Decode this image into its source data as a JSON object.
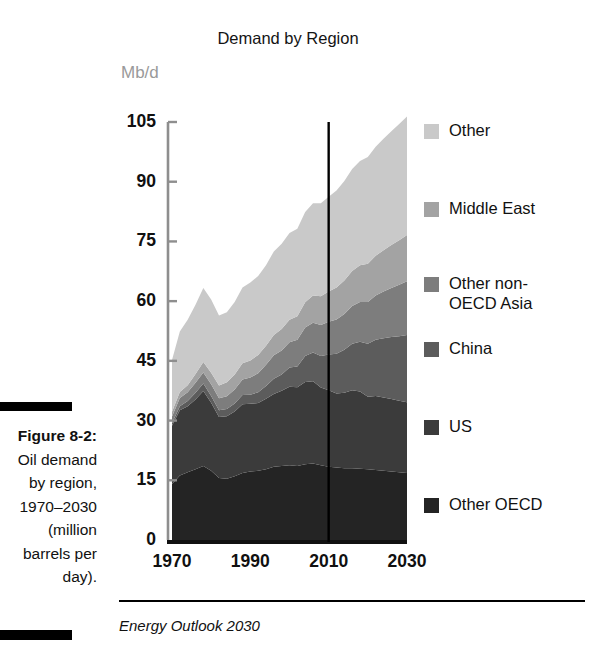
{
  "figure": {
    "label": "Figure 8-2:",
    "caption": "Oil demand by region, 1970–2030 (million barrels per day).",
    "caption_lines": [
      "Figure 8-2:",
      "Oil demand",
      "by region,",
      "1970–2030",
      "(million",
      "barrels per",
      "day)."
    ]
  },
  "source": {
    "text": "Energy Outlook 2030"
  },
  "chart_data": {
    "type": "area",
    "stacked": true,
    "title": "Demand by Region",
    "subtitle": "",
    "xlabel": "",
    "ylabel": "Mb/d",
    "unit_label": "Mb/d",
    "xlim": [
      1970,
      2030
    ],
    "ylim": [
      0,
      105
    ],
    "xticks": [
      1970,
      1990,
      2010,
      2030
    ],
    "yticks": [
      0,
      15,
      30,
      45,
      60,
      75,
      90,
      105
    ],
    "grid": false,
    "legend_position": "right",
    "annotations": [
      {
        "name": "forecast-divider",
        "type": "vline",
        "x": 2010,
        "label": ""
      }
    ],
    "colors": {
      "other": "#c9c9c9",
      "middle_east": "#a3a3a3",
      "other_non_oecd_asia": "#7d7d7d",
      "china": "#5c5c5c",
      "us": "#3b3b3b",
      "other_oecd": "#242424",
      "axis": "#8e8e8e",
      "text": "#111111",
      "unit_text": "#9a9a9a",
      "divider": "#000000"
    },
    "x": [
      1970,
      1972,
      1974,
      1976,
      1978,
      1980,
      1982,
      1984,
      1986,
      1988,
      1990,
      1992,
      1994,
      1996,
      1998,
      2000,
      2002,
      2004,
      2006,
      2008,
      2010,
      2012,
      2014,
      2016,
      2018,
      2020,
      2022,
      2024,
      2026,
      2028,
      2030
    ],
    "series": [
      {
        "name": "Other OECD",
        "key": "other_oecd",
        "color": "#242424",
        "values": [
          14.0,
          16.2,
          17.0,
          17.8,
          18.6,
          17.4,
          15.6,
          15.4,
          16.0,
          16.8,
          17.2,
          17.4,
          17.8,
          18.4,
          18.6,
          18.8,
          18.6,
          19.0,
          19.2,
          18.8,
          18.4,
          18.2,
          18.0,
          18.0,
          17.9,
          17.8,
          17.6,
          17.4,
          17.2,
          17.0,
          16.8
        ]
      },
      {
        "name": "US",
        "key": "us",
        "color": "#3b3b3b",
        "values": [
          14.7,
          16.4,
          16.6,
          17.5,
          18.8,
          17.1,
          15.3,
          15.7,
          16.3,
          17.3,
          17.0,
          17.0,
          17.7,
          18.3,
          18.9,
          19.7,
          19.8,
          20.7,
          20.7,
          19.5,
          19.2,
          18.6,
          19.0,
          19.6,
          19.4,
          18.2,
          18.6,
          18.4,
          18.2,
          18.0,
          17.8
        ]
      },
      {
        "name": "China",
        "key": "china",
        "color": "#5c5c5c",
        "values": [
          0.6,
          1.0,
          1.3,
          1.7,
          1.9,
          1.7,
          1.7,
          1.8,
          2.0,
          2.3,
          2.3,
          2.7,
          3.2,
          3.8,
          4.1,
          4.8,
          5.2,
          6.5,
          7.2,
          7.9,
          9.0,
          10.0,
          10.8,
          11.7,
          12.5,
          13.3,
          14.1,
          14.9,
          15.6,
          16.2,
          16.9
        ]
      },
      {
        "name": "Other non-OECD Asia",
        "key": "other_non_oecd_asia",
        "color": "#7d7d7d",
        "values": [
          1.7,
          2.1,
          2.2,
          2.5,
          2.8,
          2.9,
          3.0,
          3.2,
          3.5,
          3.9,
          4.3,
          4.8,
          5.3,
          5.9,
          6.0,
          6.4,
          6.7,
          7.2,
          7.5,
          7.8,
          8.2,
          8.6,
          9.0,
          9.5,
          10.0,
          10.5,
          11.1,
          11.7,
          12.3,
          12.9,
          13.5
        ]
      },
      {
        "name": "Middle East",
        "key": "middle_east",
        "color": "#a3a3a3",
        "values": [
          1.2,
          1.5,
          1.8,
          2.2,
          2.6,
          2.9,
          3.2,
          3.5,
          3.8,
          4.1,
          4.3,
          4.6,
          4.8,
          5.1,
          5.4,
          5.6,
          5.9,
          6.3,
          6.8,
          7.2,
          7.6,
          8.0,
          8.4,
          8.8,
          9.2,
          9.6,
          10.0,
          10.4,
          10.8,
          11.2,
          11.6
        ]
      },
      {
        "name": "Other",
        "key": "other",
        "color": "#c9c9c9",
        "values": [
          13.0,
          15.2,
          16.4,
          17.4,
          18.6,
          18.4,
          17.6,
          17.6,
          18.2,
          19.0,
          19.6,
          19.8,
          20.2,
          21.0,
          21.4,
          21.8,
          22.0,
          22.7,
          23.2,
          23.4,
          23.8,
          24.4,
          25.0,
          25.6,
          26.2,
          26.8,
          27.4,
          28.0,
          28.6,
          29.2,
          29.8
        ]
      }
    ]
  },
  "legend": {
    "items": [
      {
        "label": "Other",
        "color": "#c9c9c9",
        "top": 0
      },
      {
        "label": "Middle East",
        "color": "#a3a3a3",
        "top": 78
      },
      {
        "label": "Other non-\nOECD Asia",
        "color": "#7d7d7d",
        "top": 153
      },
      {
        "label": "China",
        "color": "#5c5c5c",
        "top": 218
      },
      {
        "label": "US",
        "color": "#3b3b3b",
        "top": 296
      },
      {
        "label": "Other OECD",
        "color": "#242424",
        "top": 374
      }
    ]
  },
  "axes": {
    "y_tick_labels": [
      "105",
      "90",
      "75",
      "60",
      "45",
      "30",
      "15",
      "0"
    ],
    "x_tick_labels": [
      "1970",
      "1990",
      "2010",
      "2030"
    ]
  }
}
